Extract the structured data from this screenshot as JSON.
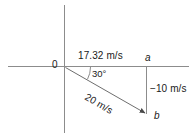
{
  "diagram": {
    "background_color": "#ffffff",
    "line_color": "#8c8c8c",
    "text_color": "#1a1a1a",
    "labels": {
      "origin": "0",
      "horizontal_component": "17.32 m/s",
      "angle": "30°",
      "point_a": "a",
      "point_b": "b",
      "vertical_component": "−10 m/s",
      "resultant": "20 m/s"
    },
    "geometry": {
      "origin_x": 65,
      "origin_y": 67,
      "point_a_x": 147,
      "point_a_y": 67,
      "point_b_x": 147,
      "point_b_y": 114,
      "x_axis_start": 8,
      "x_axis_end": 189,
      "y_axis_top": 5,
      "y_axis_bottom": 133,
      "angle_degrees": 30
    }
  }
}
